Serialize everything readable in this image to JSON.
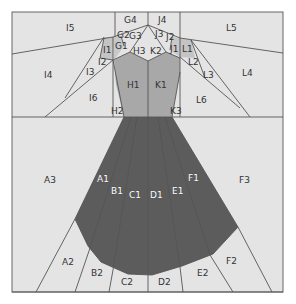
{
  "diagram": {
    "title": "",
    "colors": {
      "background": "#e4e4e4",
      "light_gray": "#e4e4e4",
      "mid_gray": "#aaaaaa",
      "shade_gray": "#c8c8c8",
      "dark_gray": "#5a5a5a",
      "line": "#555555"
    },
    "labels": {
      "G4": "G4",
      "J4": "J4",
      "G2": "G2",
      "G3": "G3",
      "J3": "J3",
      "J2": "J2",
      "G1": "G1",
      "H3": "H3",
      "K2": "K2",
      "J1": "J1",
      "I5": "I5",
      "L5": "L5",
      "I1": "I1",
      "L1": "L1",
      "I2": "I2",
      "L2": "L2",
      "I3": "I3",
      "L3": "L3",
      "I4": "I4",
      "L4": "L4",
      "H1": "H1",
      "K1": "K1",
      "I6": "I6",
      "L6": "L6",
      "H2": "H2",
      "K3": "K3",
      "A3": "A3",
      "F3": "F3",
      "A1": "A1",
      "B1": "B1",
      "C1": "C1",
      "D1": "D1",
      "E1": "E1",
      "F1": "F1",
      "A2": "A2",
      "B2": "B2",
      "C2": "C2",
      "D2": "D2",
      "E2": "E2",
      "F2": "F2"
    }
  }
}
